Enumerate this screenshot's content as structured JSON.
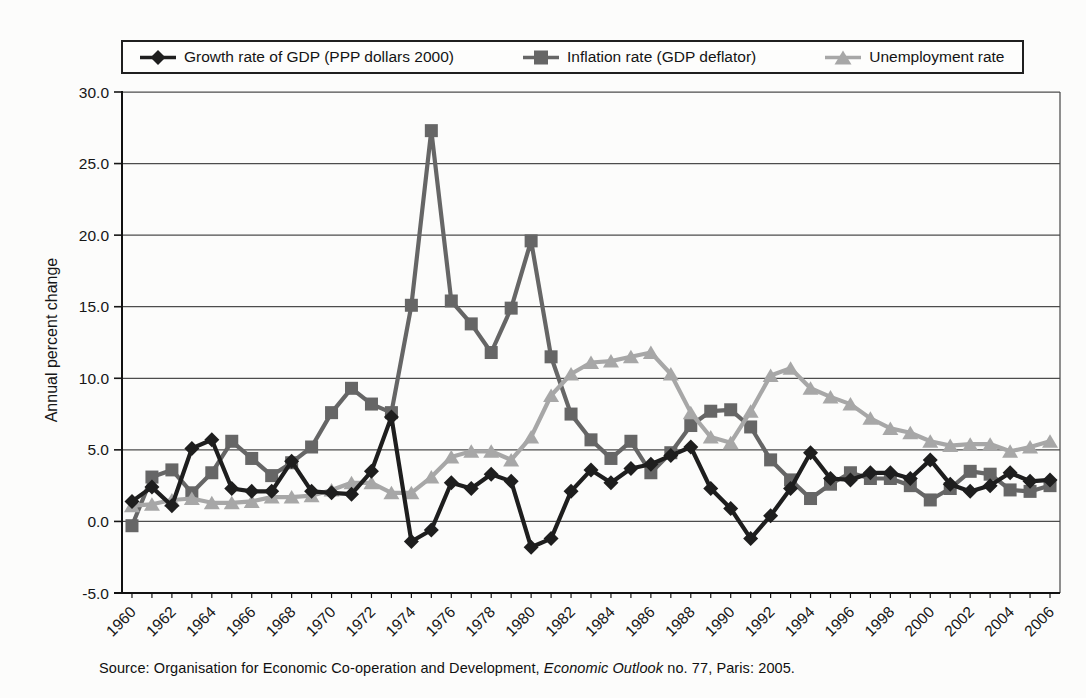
{
  "chart_data": {
    "type": "line",
    "title": "",
    "ylabel": "Annual percent change",
    "ylim": [
      -5,
      30
    ],
    "yticks": [
      30,
      25,
      20,
      15,
      10,
      5,
      0,
      -5
    ],
    "ytick_labels": [
      "30.0",
      "25.0",
      "20.0",
      "15.0",
      "10.0",
      "5.0",
      "0.0",
      "-5.0"
    ],
    "grid": "horizontal",
    "legend_position": "top",
    "x": [
      1960,
      1961,
      1962,
      1963,
      1964,
      1965,
      1966,
      1967,
      1968,
      1969,
      1970,
      1971,
      1972,
      1973,
      1974,
      1975,
      1976,
      1977,
      1978,
      1979,
      1980,
      1981,
      1982,
      1983,
      1984,
      1985,
      1986,
      1987,
      1988,
      1989,
      1990,
      1991,
      1992,
      1993,
      1994,
      1995,
      1996,
      1997,
      1998,
      1999,
      2000,
      2001,
      2002,
      2003,
      2004,
      2005,
      2006
    ],
    "xtick_labels": [
      "1960",
      "1962",
      "1964",
      "1966",
      "1968",
      "1970",
      "1972",
      "1974",
      "1976",
      "1978",
      "1980",
      "1982",
      "1984",
      "1986",
      "1988",
      "1990",
      "1992",
      "1994",
      "1996",
      "1998",
      "2000",
      "2002",
      "2004",
      "2006"
    ],
    "series": [
      {
        "name": "Growth rate of GDP (PPP dollars 2000)",
        "marker": "diamond",
        "color": "#1e1e1e",
        "values": [
          1.4,
          2.4,
          1.1,
          5.1,
          5.7,
          2.3,
          2.1,
          2.1,
          4.2,
          2.1,
          2.0,
          1.9,
          3.5,
          7.3,
          -1.4,
          -0.6,
          2.7,
          2.3,
          3.3,
          2.8,
          -1.8,
          -1.2,
          2.1,
          3.6,
          2.7,
          3.7,
          4.0,
          4.6,
          5.2,
          2.3,
          0.9,
          -1.2,
          0.4,
          2.3,
          4.8,
          3.0,
          2.9,
          3.4,
          3.4,
          3.0,
          4.3,
          2.6,
          2.1,
          2.5,
          3.4,
          2.8,
          2.9
        ]
      },
      {
        "name": "Inflation rate (GDP deflator)",
        "marker": "square",
        "color": "#666666",
        "values": [
          -0.3,
          3.1,
          3.6,
          2.0,
          3.4,
          5.6,
          4.4,
          3.2,
          4.1,
          5.2,
          7.6,
          9.3,
          8.2,
          7.6,
          15.1,
          27.3,
          15.4,
          13.8,
          11.8,
          14.9,
          19.6,
          11.5,
          7.5,
          5.7,
          4.4,
          5.6,
          3.4,
          4.8,
          6.7,
          7.7,
          7.8,
          6.6,
          4.3,
          2.9,
          1.6,
          2.6,
          3.4,
          3.0,
          3.0,
          2.5,
          1.5,
          2.3,
          3.5,
          3.3,
          2.2,
          2.1,
          2.5
        ]
      },
      {
        "name": "Unemployment rate",
        "marker": "triangle",
        "color": "#a7a7a7",
        "values": [
          1.1,
          1.2,
          1.5,
          1.6,
          1.3,
          1.3,
          1.4,
          1.7,
          1.7,
          1.8,
          2.2,
          2.7,
          2.7,
          2.0,
          2.0,
          3.1,
          4.5,
          4.9,
          4.9,
          4.3,
          5.9,
          8.8,
          10.3,
          11.1,
          11.2,
          11.5,
          11.8,
          10.3,
          7.6,
          5.9,
          5.5,
          7.7,
          10.2,
          10.7,
          9.3,
          8.7,
          8.2,
          7.2,
          6.5,
          6.2,
          5.6,
          5.3,
          5.4,
          5.4,
          4.9,
          5.2,
          5.6
        ]
      }
    ]
  },
  "source": {
    "prefix": "Source: Organisation for Economic Co-operation and Development, ",
    "italic": "Economic Outlook",
    "suffix": " no. 77, Paris: 2005."
  }
}
